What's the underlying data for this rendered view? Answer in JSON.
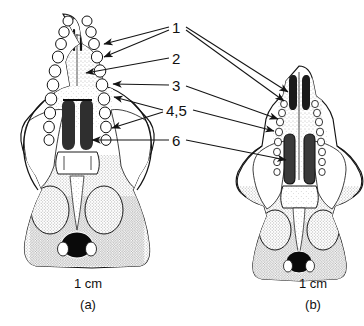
{
  "figure": {
    "type": "scientific-illustration",
    "background_color": "#ffffff",
    "ink_color": "#1a1a1a",
    "labels": [
      {
        "id": "1",
        "text": "1",
        "x": 172,
        "y": 20,
        "arrow_count": 4
      },
      {
        "id": "2",
        "text": "2",
        "x": 172,
        "y": 51,
        "arrow_count": 1
      },
      {
        "id": "3",
        "text": "3",
        "x": 172,
        "y": 78,
        "arrow_count": 2
      },
      {
        "id": "4,5",
        "text": "4,5",
        "x": 166,
        "y": 103,
        "arrow_count": 3
      },
      {
        "id": "6",
        "text": "6",
        "x": 172,
        "y": 133,
        "arrow_count": 2
      }
    ],
    "panels": [
      {
        "key": "a",
        "id_text": "(a)",
        "scale_text": "1 cm",
        "scale_x": 58,
        "scale_y": 277,
        "id_y": 298,
        "description": "Broad, robust skull; wide zygomatic arches; long cheek-tooth rows of many rounded molars; broad rostrum; paired dark palatal foramina"
      },
      {
        "key": "b",
        "id_text": "(b)",
        "scale_text": "1 cm",
        "scale_x": 283,
        "scale_y": 277,
        "id_y": 298,
        "description": "Narrower, smaller skull; slender zygomatic arches; dark incisive foramina at rostrum tip; paired elongate dark palatal vacuities"
      }
    ]
  }
}
